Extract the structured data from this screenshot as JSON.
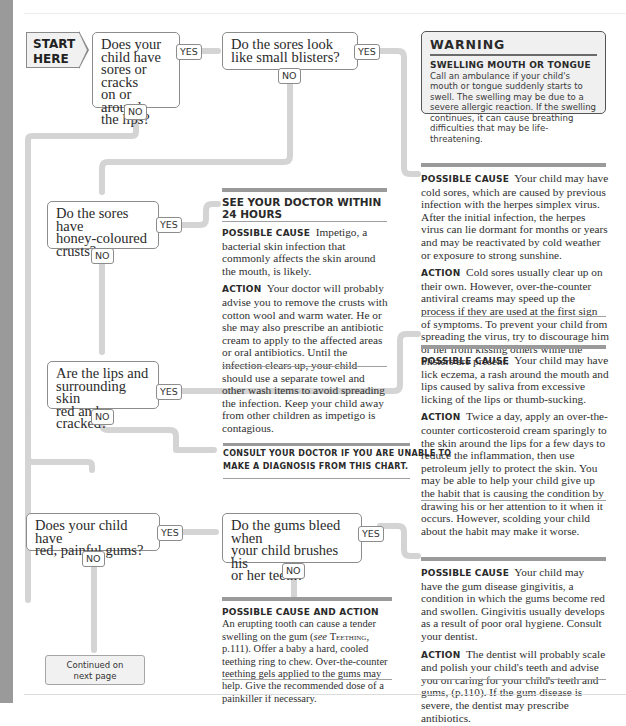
{
  "start": {
    "line1": "START",
    "line2": "HERE"
  },
  "labels": {
    "yes": "YES",
    "no": "NO"
  },
  "questions": [
    {
      "id": "q1",
      "lines": [
        "Does your",
        "child have",
        "sores or cracks",
        "on or around",
        "the lips?"
      ]
    },
    {
      "id": "q2",
      "lines": [
        "Do the sores look",
        "like small blisters?"
      ]
    },
    {
      "id": "q3",
      "lines": [
        "Do the sores have",
        "honey-coloured",
        "crusts?"
      ]
    },
    {
      "id": "q4",
      "lines": [
        "Are the lips and",
        "surrounding skin",
        "red and cracked?"
      ]
    },
    {
      "id": "q5",
      "lines": [
        "Does your child have",
        "red, painful gums?"
      ]
    },
    {
      "id": "q6",
      "lines": [
        "Do the gums bleed when",
        "your child brushes his",
        "or her teeth?"
      ]
    }
  ],
  "warning": {
    "title": "WARNING",
    "lead": "Swelling mouth or tongue",
    "body": "Call an ambulance if your child's mouth or tongue suddenly starts to swell. The swelling may be due to a severe allergic reaction. If the swelling continues, it can cause breathing difficulties that may be life-threatening."
  },
  "cold_sores": {
    "cause_label": "Possible cause",
    "cause": "Your child may have cold sores, which are caused by previous infection with the herpes simplex virus. After the initial infection, the herpes virus can lie dormant for months or years and may be reactivated by cold weather or exposure to strong sunshine.",
    "action_label": "Action",
    "action": "Cold sores usually clear up on their own. However, over-the-counter antiviral creams may speed up the process if they are used at the first sign of symptoms. To prevent your child from spreading the virus, try to discourage him or her from kissing others while the blisters are present."
  },
  "impetigo": {
    "header_line1": "SEE YOUR DOCTOR WITHIN",
    "header_line2": "24 HOURS",
    "cause_label": "Possible cause",
    "cause": "Impetigo, a bacterial skin infection that commonly affects the skin around the mouth, is likely.",
    "action_label": "Action",
    "action": "Your doctor will probably advise you to remove the crusts with cotton wool and warm water. He or she may also prescribe an antibiotic cream to apply to the affected areas or oral antibiotics. Until the infection clears up, your child should use a separate towel and other wash items to avoid spreading the infection. Keep your child away from other children as impetigo is contagious."
  },
  "lick_eczema": {
    "cause_label": "Possible cause",
    "cause": "Your child may have lick eczema, a rash around the mouth and lips caused by saliva from excessive licking of the lips or thumb-sucking.",
    "action_label": "Action",
    "action": "Twice a day, apply an over-the-counter corticosteroid cream sparingly to the skin around the lips for a few days to reduce the inflammation, then use petroleum jelly to protect the skin. You may be able to help your child give up the habit that is causing the condition by drawing his or her attention to it when it occurs. However, scolding your child about the habit may make it worse."
  },
  "consult": {
    "line1": "Consult your doctor if you are unable to",
    "line2": "make a diagnosis from this chart."
  },
  "teething": {
    "label": "Possible cause and action",
    "text_before": "An erupting tooth can cause a tender swelling on the gum (",
    "see": "see",
    "ref": "Teething",
    "text_after": ", p.111). Offer a baby a hard, cooled teething ring to chew. Over-the-counter teething gels applied to the gums may help. Give the recommended dose of a painkiller if necessary."
  },
  "gingivitis": {
    "cause_label": "Possible cause",
    "cause": "Your child may have the gum disease gingivitis, a condition in which the gums become red and swollen. Gingivitis usually develops as a result of poor oral hygiene. Consult your dentist.",
    "action_label": "Action",
    "action": "The dentist will probably scale and polish your child's teeth and advise you on caring for your child's teeth and gums, (p.110). If the gum disease is severe, the dentist may prescribe antibiotics."
  },
  "continued": {
    "line1": "Continued on",
    "line2": "next page"
  }
}
